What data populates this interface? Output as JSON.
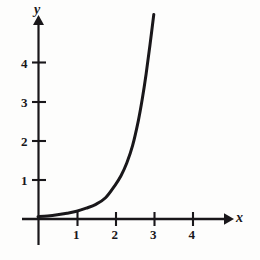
{
  "figure": {
    "name": "exponential-growth-graph",
    "background_color": "#fdfdfc",
    "ink_color": "#19171a"
  },
  "axes": {
    "x_name": "x",
    "y_name": "y",
    "x_ticks": [
      "1",
      "2",
      "3",
      "4"
    ],
    "y_ticks": [
      "1",
      "2",
      "3",
      "4"
    ],
    "origin_label": ""
  },
  "chart_data": {
    "type": "line",
    "title": "",
    "subtitle": "",
    "xlabel": "x",
    "ylabel": "y",
    "xlim": [
      -0.42,
      4.87
    ],
    "ylim": [
      -0.67,
      5.15
    ],
    "xticks": [
      1,
      2,
      3,
      4
    ],
    "yticks": [
      1,
      2,
      3,
      4
    ],
    "grid": false,
    "legend": null,
    "legend_position": "none",
    "annotations": [],
    "series": [
      {
        "name": "exponential curve",
        "color": "#19171a",
        "line_width": 3,
        "x": [
          0,
          0.25,
          0.5,
          0.75,
          1,
          1.25,
          1.5,
          1.75,
          2,
          2.15,
          2.3,
          2.45,
          2.6,
          2.7,
          2.8,
          2.9,
          3
        ],
        "y": [
          0.06,
          0.08,
          0.11,
          0.15,
          0.2,
          0.28,
          0.38,
          0.55,
          0.88,
          1.12,
          1.45,
          1.9,
          2.55,
          3.1,
          3.75,
          4.5,
          5.3
        ]
      }
    ]
  }
}
